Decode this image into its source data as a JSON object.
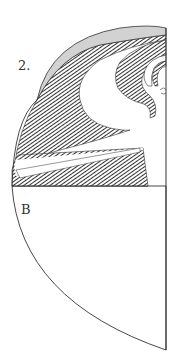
{
  "figure": {
    "number_label": "2.",
    "point_label": "B",
    "colors": {
      "outline": "#333333",
      "gray_fill": "#d2d2d2",
      "hatch": "#333333",
      "background": "#ffffff"
    },
    "regions": [
      {
        "name": "gray-crescent",
        "fill": "gray"
      },
      {
        "name": "large-hatched-wave",
        "fill": "hatch"
      },
      {
        "name": "inner-hatched-curl",
        "fill": "hatch"
      },
      {
        "name": "innermost-hatched-curl",
        "fill": "hatch"
      },
      {
        "name": "hatched-wedge",
        "fill": "hatch"
      },
      {
        "name": "white-bar",
        "fill": "white"
      },
      {
        "name": "lower-quarter-disc",
        "fill": "white"
      }
    ]
  }
}
